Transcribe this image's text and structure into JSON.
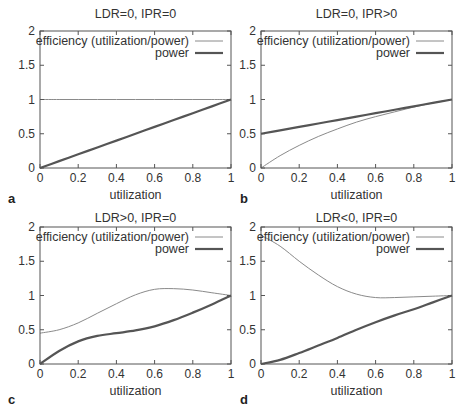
{
  "colors": {
    "efficiency": "#8a8a8a",
    "power": "#555555",
    "text": "#333333"
  },
  "chart_data": [
    {
      "type": "line",
      "panel_letter": "a",
      "title": "LDR=0, IPR=0",
      "xlabel": "utilization",
      "ylabel": "",
      "xlim": [
        0,
        1
      ],
      "ylim": [
        0,
        2
      ],
      "xticks": [
        "0",
        "0.2",
        "0.4",
        "0.6",
        "0.8",
        "1"
      ],
      "yticks": [
        "0",
        "0.5",
        "1",
        "1.5",
        "2"
      ],
      "grid": false,
      "legend_position": "top-right",
      "x": [
        0,
        0.1,
        0.2,
        0.3,
        0.4,
        0.5,
        0.6,
        0.7,
        0.8,
        0.9,
        1.0
      ],
      "series": [
        {
          "name": "efficiency (utilization/power)",
          "style": "thin",
          "values": [
            1,
            1,
            1,
            1,
            1,
            1,
            1,
            1,
            1,
            1,
            1
          ]
        },
        {
          "name": "power",
          "style": "thick",
          "values": [
            0,
            0.1,
            0.2,
            0.3,
            0.4,
            0.5,
            0.6,
            0.7,
            0.8,
            0.9,
            1.0
          ]
        }
      ]
    },
    {
      "type": "line",
      "panel_letter": "b",
      "title": "LDR=0, IPR>0",
      "xlabel": "utilization",
      "ylabel": "",
      "xlim": [
        0,
        1
      ],
      "ylim": [
        0,
        2
      ],
      "xticks": [
        "0",
        "0.2",
        "0.4",
        "0.6",
        "0.8",
        "1"
      ],
      "yticks": [
        "0",
        "0.5",
        "1",
        "1.5",
        "2"
      ],
      "grid": false,
      "legend_position": "top-right",
      "x": [
        0,
        0.1,
        0.2,
        0.3,
        0.4,
        0.5,
        0.6,
        0.7,
        0.8,
        0.9,
        1.0
      ],
      "series": [
        {
          "name": "efficiency (utilization/power)",
          "style": "thin",
          "values": [
            0,
            0.18,
            0.33,
            0.46,
            0.57,
            0.67,
            0.75,
            0.82,
            0.89,
            0.95,
            1.0
          ]
        },
        {
          "name": "power",
          "style": "thick",
          "values": [
            0.5,
            0.55,
            0.6,
            0.65,
            0.7,
            0.75,
            0.8,
            0.85,
            0.9,
            0.95,
            1.0
          ]
        }
      ]
    },
    {
      "type": "line",
      "panel_letter": "c",
      "title": "LDR>0, IPR=0",
      "xlabel": "utilization",
      "ylabel": "",
      "xlim": [
        0,
        1
      ],
      "ylim": [
        0,
        2
      ],
      "xticks": [
        "0",
        "0.2",
        "0.4",
        "0.6",
        "0.8",
        "1"
      ],
      "yticks": [
        "0",
        "0.5",
        "1",
        "1.5",
        "2"
      ],
      "grid": false,
      "legend_position": "top-right",
      "x": [
        0,
        0.1,
        0.2,
        0.3,
        0.4,
        0.5,
        0.6,
        0.7,
        0.8,
        0.9,
        1.0
      ],
      "series": [
        {
          "name": "efficiency (utilization/power)",
          "style": "thin",
          "values": [
            0.45,
            0.5,
            0.6,
            0.74,
            0.88,
            1.01,
            1.09,
            1.1,
            1.08,
            1.04,
            1.0
          ]
        },
        {
          "name": "power",
          "style": "thick",
          "values": [
            0,
            0.19,
            0.33,
            0.41,
            0.45,
            0.49,
            0.55,
            0.64,
            0.75,
            0.87,
            1.0
          ]
        }
      ]
    },
    {
      "type": "line",
      "panel_letter": "d",
      "title": "LDR<0, IPR=0",
      "xlabel": "utilization",
      "ylabel": "",
      "xlim": [
        0,
        1
      ],
      "ylim": [
        0,
        2
      ],
      "xticks": [
        "0",
        "0.2",
        "0.4",
        "0.6",
        "0.8",
        "1"
      ],
      "yticks": [
        "0",
        "0.5",
        "1",
        "1.5",
        "2"
      ],
      "grid": false,
      "legend_position": "top-right",
      "x": [
        0,
        0.1,
        0.2,
        0.3,
        0.4,
        0.5,
        0.6,
        0.7,
        0.8,
        0.9,
        1.0
      ],
      "series": [
        {
          "name": "efficiency (utilization/power)",
          "style": "thin",
          "values": [
            1.88,
            1.72,
            1.5,
            1.3,
            1.13,
            1.02,
            0.97,
            0.97,
            0.98,
            0.99,
            1.0
          ]
        },
        {
          "name": "power",
          "style": "thick",
          "values": [
            0,
            0.06,
            0.16,
            0.27,
            0.38,
            0.5,
            0.61,
            0.71,
            0.8,
            0.9,
            1.0
          ]
        }
      ]
    }
  ]
}
